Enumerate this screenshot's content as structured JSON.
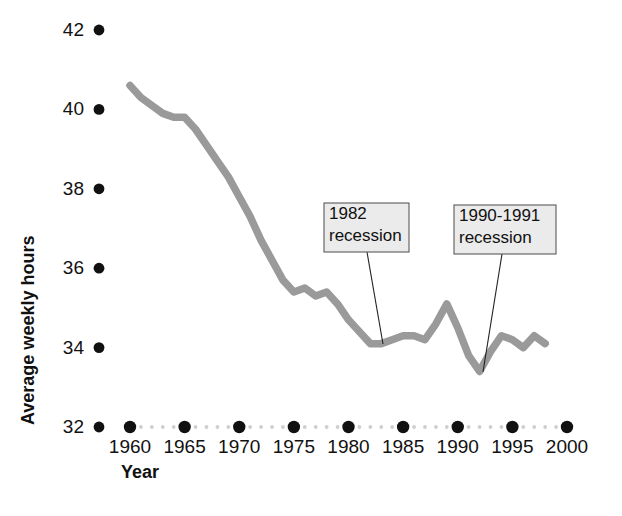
{
  "chart_data": {
    "type": "line",
    "title": "",
    "xlabel": "Year",
    "ylabel": "Average weekly hours",
    "xlim": [
      1958,
      2001
    ],
    "ylim": [
      32,
      42
    ],
    "grid": false,
    "legend": null,
    "line_color": "#9a9a9a",
    "axis_color": "#111111",
    "x_tick_labels": [
      "1960",
      "1965",
      "1970",
      "1975",
      "1980",
      "1985",
      "1990",
      "1995",
      "2000"
    ],
    "x_ticks": [
      1960,
      1965,
      1970,
      1975,
      1980,
      1985,
      1990,
      1995,
      2000
    ],
    "y_tick_labels": [
      "32",
      "34",
      "36",
      "38",
      "40",
      "42"
    ],
    "y_ticks": [
      32,
      34,
      36,
      38,
      40,
      42
    ],
    "series": [
      {
        "name": "Average weekly hours",
        "x": [
          1960,
          1961,
          1962,
          1963,
          1964,
          1965,
          1966,
          1967,
          1968,
          1969,
          1970,
          1971,
          1972,
          1973,
          1974,
          1975,
          1976,
          1977,
          1978,
          1979,
          1980,
          1981,
          1982,
          1983,
          1984,
          1985,
          1986,
          1987,
          1988,
          1989,
          1990,
          1991,
          1992,
          1993,
          1994,
          1995,
          1996,
          1997,
          1998
        ],
        "values": [
          40.6,
          40.3,
          40.1,
          39.9,
          39.8,
          39.8,
          39.5,
          39.1,
          38.7,
          38.3,
          37.8,
          37.3,
          36.7,
          36.2,
          35.7,
          35.4,
          35.5,
          35.3,
          35.4,
          35.1,
          34.7,
          34.4,
          34.1,
          34.1,
          34.2,
          34.3,
          34.3,
          34.2,
          34.6,
          35.1,
          34.5,
          33.8,
          33.4,
          33.9,
          34.3,
          34.2,
          34.0,
          34.3,
          34.1
        ]
      }
    ],
    "annotations": [
      {
        "id": "recession-1982",
        "line1": "1982",
        "line2": "recession",
        "box": {
          "x": 324,
          "y": 203,
          "width": 85,
          "height": 49
        },
        "leader": {
          "x1": 367,
          "y1": 252,
          "x2": 383,
          "y2": 344
        }
      },
      {
        "id": "recession-1990-1991",
        "line1": "1990-1991",
        "line2": "recession",
        "box": {
          "x": 454,
          "y": 205,
          "width": 102,
          "height": 49
        },
        "leader": {
          "x1": 502,
          "y1": 254,
          "x2": 483,
          "y2": 372
        }
      }
    ]
  },
  "colors": {
    "line": "#9a9a9a",
    "text": "#111111",
    "annotation_fill": "#ebebeb",
    "annotation_border": "#5a5a5a",
    "minor_tick": "#cfcfcf",
    "background": "#ffffff"
  }
}
